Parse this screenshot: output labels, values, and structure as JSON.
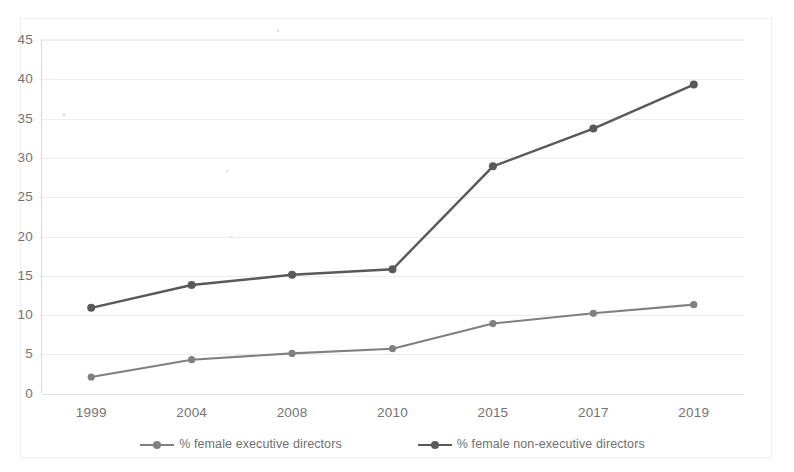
{
  "chart_data": {
    "type": "line",
    "title": "",
    "subtitle": "",
    "xlabel": "",
    "ylabel": "",
    "categories": [
      "1999",
      "2004",
      "2008",
      "2010",
      "2015",
      "2017",
      "2019"
    ],
    "series": [
      {
        "name": "% female executive directors",
        "color": "#808080",
        "marker": "circle",
        "values": [
          2.0,
          4.2,
          5.0,
          5.6,
          8.8,
          10.1,
          11.2
        ]
      },
      {
        "name": "% female non-executive directors",
        "color": "#595959",
        "marker": "circle",
        "values": [
          10.8,
          13.7,
          15.0,
          15.7,
          28.8,
          33.6,
          39.2
        ]
      }
    ],
    "ylim": [
      0,
      45
    ],
    "yticks": [
      0,
      5,
      10,
      15,
      20,
      25,
      30,
      35,
      40,
      45
    ],
    "ytick_labels": [
      "0",
      "5",
      "10",
      "15",
      "20",
      "25",
      "30",
      "35",
      "40",
      "45"
    ],
    "grid": "horizontal",
    "legend_position": "bottom",
    "axis_color": "#d9d9d9",
    "grid_color": "#ececec",
    "background": "#ffffff"
  },
  "legend": {
    "items": [
      {
        "label": "% female executive directors",
        "color": "#808080"
      },
      {
        "label": "% female non-executive directors",
        "color": "#595959"
      }
    ]
  }
}
